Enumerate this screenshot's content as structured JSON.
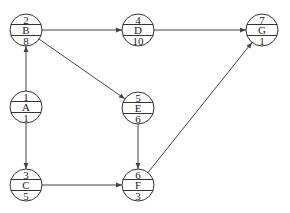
{
  "diagram": {
    "type": "activity-on-node network",
    "nodes": [
      {
        "id": "A",
        "top": "1",
        "mid": "A",
        "bottom": "1",
        "x": 26,
        "y": 107
      },
      {
        "id": "B",
        "top": "2",
        "mid": "B",
        "bottom": "8",
        "x": 26,
        "y": 30
      },
      {
        "id": "C",
        "top": "3",
        "mid": "C",
        "bottom": "5",
        "x": 26,
        "y": 185
      },
      {
        "id": "D",
        "top": "4",
        "mid": "D",
        "bottom": "10",
        "x": 138,
        "y": 30
      },
      {
        "id": "E",
        "top": "5",
        "mid": "E",
        "bottom": "6",
        "x": 138,
        "y": 108
      },
      {
        "id": "F",
        "top": "6",
        "mid": "F",
        "bottom": "3",
        "x": 138,
        "y": 185
      },
      {
        "id": "G",
        "top": "7",
        "mid": "G",
        "bottom": "1",
        "x": 262,
        "y": 30
      }
    ],
    "edges": [
      {
        "from": "A",
        "to": "B"
      },
      {
        "from": "A",
        "to": "C"
      },
      {
        "from": "B",
        "to": "D"
      },
      {
        "from": "B",
        "to": "E"
      },
      {
        "from": "C",
        "to": "F"
      },
      {
        "from": "E",
        "to": "F"
      },
      {
        "from": "D",
        "to": "G"
      },
      {
        "from": "F",
        "to": "G"
      }
    ],
    "node_radius": 16,
    "colors": {
      "stroke": "#333333",
      "text": "#222222",
      "background": "#ffffff"
    }
  }
}
